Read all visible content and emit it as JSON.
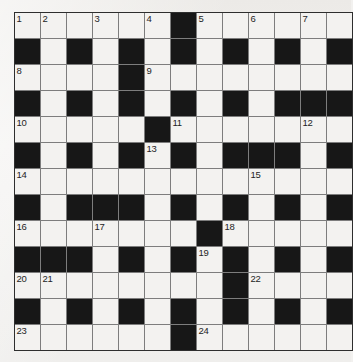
{
  "puzzle": {
    "name": "crossword-grid",
    "rows": 13,
    "columns": 13,
    "cell_size_px": 25,
    "colors": {
      "white_cell": "#f3f2f0",
      "black_cell": "#171717",
      "grid_line": "#7d7d7d",
      "border": "#2e2e2e",
      "number_text": "#242424",
      "page_background": "#f2f1ef"
    },
    "legend": {
      "0": "white (fillable) cell",
      "1": "black (blocked) cell"
    },
    "grid": [
      [
        0,
        0,
        0,
        0,
        0,
        0,
        1,
        0,
        0,
        0,
        0,
        0,
        0
      ],
      [
        1,
        0,
        1,
        0,
        1,
        0,
        1,
        0,
        1,
        0,
        1,
        0,
        1
      ],
      [
        0,
        0,
        0,
        0,
        1,
        0,
        0,
        0,
        0,
        0,
        0,
        0,
        0
      ],
      [
        1,
        0,
        1,
        0,
        1,
        0,
        1,
        0,
        1,
        0,
        1,
        1,
        1
      ],
      [
        0,
        0,
        0,
        0,
        0,
        1,
        0,
        0,
        0,
        0,
        0,
        0,
        0
      ],
      [
        1,
        0,
        1,
        0,
        1,
        0,
        1,
        0,
        1,
        1,
        1,
        0,
        1
      ],
      [
        0,
        0,
        0,
        0,
        0,
        0,
        0,
        0,
        0,
        0,
        0,
        0,
        0
      ],
      [
        1,
        0,
        1,
        1,
        1,
        0,
        1,
        0,
        1,
        0,
        1,
        0,
        1
      ],
      [
        0,
        0,
        0,
        0,
        0,
        0,
        0,
        1,
        0,
        0,
        0,
        0,
        0
      ],
      [
        1,
        1,
        1,
        0,
        1,
        0,
        1,
        0,
        1,
        0,
        1,
        0,
        1
      ],
      [
        0,
        0,
        0,
        0,
        0,
        0,
        0,
        0,
        1,
        0,
        0,
        0,
        0
      ],
      [
        1,
        0,
        1,
        0,
        1,
        0,
        1,
        0,
        1,
        0,
        1,
        0,
        1
      ],
      [
        0,
        0,
        0,
        0,
        0,
        0,
        1,
        0,
        0,
        0,
        0,
        0,
        0
      ]
    ],
    "numbers": [
      {
        "label": "1",
        "row": 1,
        "col": 1
      },
      {
        "label": "2",
        "row": 1,
        "col": 2
      },
      {
        "label": "3",
        "row": 1,
        "col": 4
      },
      {
        "label": "4",
        "row": 1,
        "col": 6
      },
      {
        "label": "5",
        "row": 1,
        "col": 8
      },
      {
        "label": "6",
        "row": 1,
        "col": 10
      },
      {
        "label": "7",
        "row": 1,
        "col": 12
      },
      {
        "label": "8",
        "row": 3,
        "col": 1
      },
      {
        "label": "9",
        "row": 3,
        "col": 6
      },
      {
        "label": "10",
        "row": 5,
        "col": 1
      },
      {
        "label": "11",
        "row": 5,
        "col": 7
      },
      {
        "label": "12",
        "row": 5,
        "col": 12
      },
      {
        "label": "13",
        "row": 6,
        "col": 6
      },
      {
        "label": "14",
        "row": 7,
        "col": 1
      },
      {
        "label": "15",
        "row": 7,
        "col": 10
      },
      {
        "label": "16",
        "row": 9,
        "col": 1
      },
      {
        "label": "17",
        "row": 9,
        "col": 4
      },
      {
        "label": "18",
        "row": 9,
        "col": 9
      },
      {
        "label": "19",
        "row": 10,
        "col": 8
      },
      {
        "label": "20",
        "row": 11,
        "col": 1
      },
      {
        "label": "21",
        "row": 11,
        "col": 2
      },
      {
        "label": "22",
        "row": 11,
        "col": 10
      },
      {
        "label": "23",
        "row": 13,
        "col": 1
      },
      {
        "label": "24",
        "row": 13,
        "col": 8
      }
    ]
  }
}
